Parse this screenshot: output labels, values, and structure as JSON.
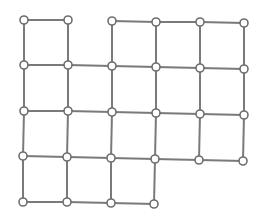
{
  "diagram": {
    "type": "grid-graph",
    "colors": {
      "edge": "#7a7a7a",
      "node_stroke": "#6e6e6e",
      "node_fill": "#ffffff",
      "background": "#ffffff"
    },
    "node_radius": 4,
    "nodes": [
      {
        "id": "r1c1",
        "x": 24,
        "y": 20
      },
      {
        "id": "r1c2",
        "x": 68,
        "y": 20
      },
      {
        "id": "r1c3",
        "x": 112,
        "y": 21
      },
      {
        "id": "r1c4",
        "x": 156,
        "y": 22
      },
      {
        "id": "r1c5",
        "x": 200,
        "y": 22
      },
      {
        "id": "r1c6",
        "x": 244,
        "y": 23
      },
      {
        "id": "r2c1",
        "x": 24,
        "y": 65
      },
      {
        "id": "r2c2",
        "x": 68,
        "y": 65
      },
      {
        "id": "r2c3",
        "x": 112,
        "y": 66
      },
      {
        "id": "r2c4",
        "x": 156,
        "y": 67
      },
      {
        "id": "r2c5",
        "x": 200,
        "y": 68
      },
      {
        "id": "r2c6",
        "x": 244,
        "y": 69
      },
      {
        "id": "r3c1",
        "x": 24,
        "y": 111
      },
      {
        "id": "r3c2",
        "x": 68,
        "y": 111
      },
      {
        "id": "r3c3",
        "x": 112,
        "y": 112
      },
      {
        "id": "r3c4",
        "x": 156,
        "y": 113
      },
      {
        "id": "r3c5",
        "x": 200,
        "y": 114
      },
      {
        "id": "r3c6",
        "x": 244,
        "y": 115
      },
      {
        "id": "r4c1",
        "x": 23,
        "y": 156
      },
      {
        "id": "r4c2",
        "x": 67,
        "y": 157
      },
      {
        "id": "r4c3",
        "x": 111,
        "y": 158
      },
      {
        "id": "r4c4",
        "x": 155,
        "y": 159
      },
      {
        "id": "r4c5",
        "x": 199,
        "y": 160
      },
      {
        "id": "r4c6",
        "x": 243,
        "y": 161
      },
      {
        "id": "r5c1",
        "x": 23,
        "y": 202
      },
      {
        "id": "r5c2",
        "x": 67,
        "y": 202
      },
      {
        "id": "r5c3",
        "x": 111,
        "y": 203
      },
      {
        "id": "r5c4",
        "x": 154,
        "y": 204
      }
    ],
    "edges": [
      [
        "r1c1",
        "r1c2"
      ],
      [
        "r1c3",
        "r1c4"
      ],
      [
        "r1c4",
        "r1c5"
      ],
      [
        "r1c5",
        "r1c6"
      ],
      [
        "r2c1",
        "r2c2"
      ],
      [
        "r2c2",
        "r2c3"
      ],
      [
        "r2c3",
        "r2c4"
      ],
      [
        "r2c4",
        "r2c5"
      ],
      [
        "r2c5",
        "r2c6"
      ],
      [
        "r3c1",
        "r3c2"
      ],
      [
        "r3c2",
        "r3c3"
      ],
      [
        "r3c3",
        "r3c4"
      ],
      [
        "r3c4",
        "r3c5"
      ],
      [
        "r3c5",
        "r3c6"
      ],
      [
        "r4c1",
        "r4c2"
      ],
      [
        "r4c2",
        "r4c3"
      ],
      [
        "r4c3",
        "r4c4"
      ],
      [
        "r4c4",
        "r4c5"
      ],
      [
        "r4c5",
        "r4c6"
      ],
      [
        "r5c1",
        "r5c2"
      ],
      [
        "r5c2",
        "r5c3"
      ],
      [
        "r5c3",
        "r5c4"
      ],
      [
        "r1c1",
        "r2c1"
      ],
      [
        "r2c1",
        "r3c1"
      ],
      [
        "r3c1",
        "r4c1"
      ],
      [
        "r4c1",
        "r5c1"
      ],
      [
        "r1c2",
        "r2c2"
      ],
      [
        "r2c2",
        "r3c2"
      ],
      [
        "r3c2",
        "r4c2"
      ],
      [
        "r4c2",
        "r5c2"
      ],
      [
        "r1c3",
        "r2c3"
      ],
      [
        "r2c3",
        "r3c3"
      ],
      [
        "r3c3",
        "r4c3"
      ],
      [
        "r4c3",
        "r5c3"
      ],
      [
        "r1c4",
        "r2c4"
      ],
      [
        "r2c4",
        "r3c4"
      ],
      [
        "r3c4",
        "r4c4"
      ],
      [
        "r4c4",
        "r5c4"
      ],
      [
        "r1c5",
        "r2c5"
      ],
      [
        "r2c5",
        "r3c5"
      ],
      [
        "r3c5",
        "r4c5"
      ],
      [
        "r1c6",
        "r2c6"
      ],
      [
        "r2c6",
        "r3c6"
      ],
      [
        "r3c6",
        "r4c6"
      ]
    ]
  }
}
